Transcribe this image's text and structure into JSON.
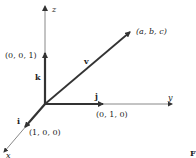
{
  "diagram": {
    "axes": {
      "z": {
        "label": "z"
      },
      "y": {
        "label": "y"
      },
      "x": {
        "label": "x"
      }
    },
    "unit_vectors": {
      "k": {
        "label": "k",
        "point": "(0, 0, 1)"
      },
      "j": {
        "label": "j",
        "point": "(0, 1, 0)"
      },
      "i": {
        "label": "i",
        "point": "(1, 0, 0)"
      }
    },
    "vector": {
      "label": "v",
      "point": "(a, b, c)"
    },
    "cropped_caption_fragment": "F",
    "colors": {
      "axis": "#777777",
      "vector": "#333333",
      "text": "#222222"
    }
  }
}
